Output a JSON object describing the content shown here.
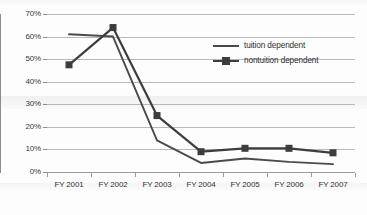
{
  "chart_data": {
    "type": "line",
    "title": "",
    "xlabel": "",
    "ylabel": "",
    "categories": [
      "FY 2001",
      "FY 2002",
      "FY 2003",
      "FY 2004",
      "FY 2005",
      "FY 2006",
      "FY 2007"
    ],
    "ylim": [
      0,
      70
    ],
    "ytick_labels": [
      "0%",
      "10%",
      "20%",
      "30%",
      "40%",
      "50%",
      "60%",
      "70%"
    ],
    "ytick_values": [
      0,
      10,
      20,
      30,
      40,
      50,
      60,
      70
    ],
    "grid": true,
    "legend_position": "inside-upper-right",
    "series": [
      {
        "name": "tuition dependent",
        "marker": "none",
        "color": "#4a4a4a",
        "values": [
          61,
          60,
          14,
          4,
          6,
          4.5,
          3.5
        ]
      },
      {
        "name": "nontuition dependent",
        "marker": "square",
        "color": "#3d3d3d",
        "values": [
          47.5,
          64,
          25,
          9,
          10.5,
          10.5,
          8.5
        ]
      }
    ]
  },
  "legend": {
    "items": [
      {
        "label": "tuition dependent"
      },
      {
        "label": "nontuition dependent"
      }
    ]
  }
}
